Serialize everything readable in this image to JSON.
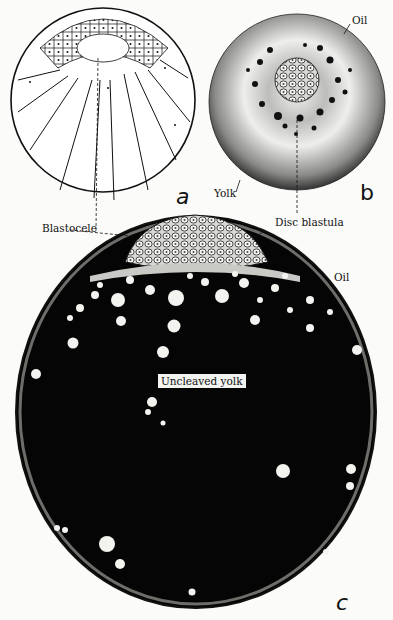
{
  "figure": {
    "panels": [
      {
        "id": "a",
        "letter": "a"
      },
      {
        "id": "b",
        "letter": "b"
      },
      {
        "id": "c",
        "letter": "c"
      }
    ],
    "labels": {
      "oil_b": "Oil",
      "yolk_b": "Yolk",
      "blastocele": "Blastocele",
      "disc_blastula": "Disc blastula",
      "oil_c": "Oil",
      "uncleaved_yolk": "Uncleaved yolk"
    },
    "colors": {
      "ink": "#111111",
      "paper": "#fbfbf9",
      "yolk_fill": "#050505",
      "oil_droplet": "#f3f3f0"
    }
  }
}
